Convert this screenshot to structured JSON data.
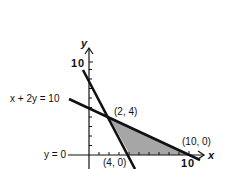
{
  "figure": {
    "axis_labels": {
      "x": "x",
      "y": "y"
    },
    "tick_labels": {
      "y_top": "10",
      "x_right": "10"
    },
    "lines": [
      {
        "name": "constraint-2x-plus-y-equals-8",
        "label": ""
      },
      {
        "name": "constraint-x-plus-2y-equals-10",
        "label": "x + 2y = 10"
      },
      {
        "name": "x-axis-constraint",
        "label": "y = 0"
      }
    ],
    "points": [
      {
        "label": "(2, 4)",
        "x": 2,
        "y": 4
      },
      {
        "label": "(4, 0)",
        "x": 4,
        "y": 0
      },
      {
        "label": "(10, 0)",
        "x": 10,
        "y": 0
      }
    ],
    "colors": {
      "line": "#111111",
      "shade": "#a6a6a6",
      "background": "#ffffff"
    }
  }
}
